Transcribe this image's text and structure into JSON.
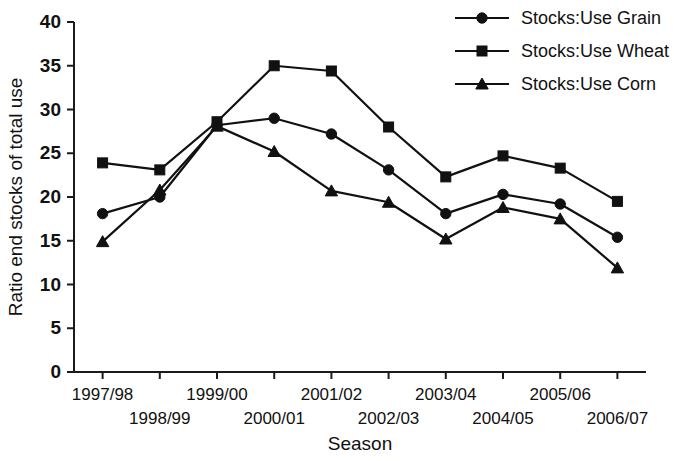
{
  "chart_data": {
    "type": "line",
    "title": "",
    "xlabel": "Season",
    "ylabel": "Ratio end stocks of total use",
    "categories": [
      "1997/98",
      "1998/99",
      "1999/00",
      "2000/01",
      "2001/02",
      "2002/03",
      "2003/04",
      "2004/05",
      "2005/06",
      "2006/07"
    ],
    "ylim": [
      0,
      40
    ],
    "yticks": [
      0,
      5,
      10,
      15,
      20,
      25,
      30,
      35,
      40
    ],
    "grid": false,
    "legend_position": "top-right",
    "series": [
      {
        "name": "Stocks:Use Grain",
        "marker": "circle",
        "color": "#111111",
        "values": [
          18.1,
          20.0,
          28.2,
          29.0,
          27.2,
          23.1,
          18.1,
          20.3,
          19.2,
          15.4
        ]
      },
      {
        "name": "Stocks:Use Wheat",
        "marker": "square",
        "color": "#111111",
        "values": [
          23.9,
          23.1,
          28.6,
          35.0,
          34.4,
          28.0,
          22.3,
          24.7,
          23.3,
          19.5
        ]
      },
      {
        "name": "Stocks:Use Corn",
        "marker": "triangle",
        "color": "#111111",
        "values": [
          14.9,
          20.8,
          28.1,
          25.2,
          20.7,
          19.4,
          15.2,
          18.8,
          17.5,
          11.9
        ]
      }
    ]
  }
}
